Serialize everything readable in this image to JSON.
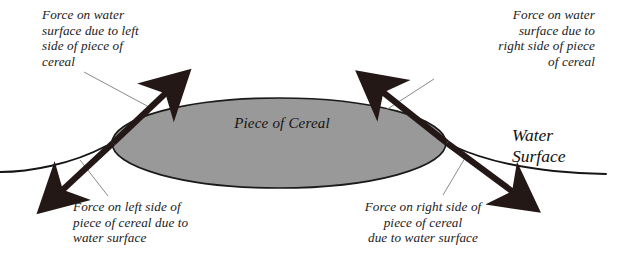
{
  "figure": {
    "type": "physics-force-diagram",
    "background_color": "#ffffff"
  },
  "object": {
    "label": "Piece of Cereal",
    "shape": "ellipse",
    "fill_color": "#999999",
    "stroke_color": "#1a1a1a"
  },
  "water": {
    "label": "Water\nSurface",
    "curve_color": "#151515"
  },
  "labels": {
    "top_left": "Force on water\nsurface due to left\nside of piece of\ncereal",
    "top_right": "Force on water\nsurface due to\nright side of piece\nof cereal",
    "bottom_left": "Force on left side of\npiece of cereal due to\nwater surface",
    "bottom_right": "Force on right side of\npiece of cereal\ndue to water surface"
  },
  "arrows": [
    {
      "name": "force-on-water-left",
      "direction": "up-right",
      "color": "#231815",
      "from": [
        113,
        143
      ],
      "to": [
        188,
        72
      ]
    },
    {
      "name": "force-on-water-right",
      "direction": "up-left",
      "color": "#231815",
      "from": [
        447,
        143
      ],
      "to": [
        358,
        72
      ]
    },
    {
      "name": "force-on-cereal-left",
      "direction": "down-left",
      "color": "#231815",
      "from": [
        113,
        143
      ],
      "to": [
        38,
        213
      ]
    },
    {
      "name": "force-on-cereal-right",
      "direction": "down-right",
      "color": "#231815",
      "from": [
        447,
        143
      ],
      "to": [
        540,
        212
      ]
    }
  ],
  "leader_lines": {
    "color": "#8a8a8a"
  }
}
